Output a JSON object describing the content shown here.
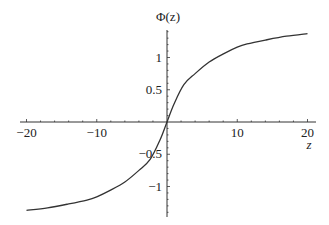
{
  "chart_data": {
    "type": "line",
    "title": "",
    "xlabel": "z",
    "ylabel": "Φ(z)",
    "xlim": [
      -20,
      20
    ],
    "ylim": [
      -1.4,
      1.4
    ],
    "grid": false,
    "legend": null,
    "x_ticks": [
      {
        "value": -20,
        "label": "−20"
      },
      {
        "value": -10,
        "label": "−10"
      },
      {
        "value": 10,
        "label": "10"
      },
      {
        "value": 20,
        "label": "20"
      }
    ],
    "y_ticks": [
      {
        "value": 1,
        "label": "1"
      },
      {
        "value": 0.5,
        "label": "0.5"
      },
      {
        "value": -0.5,
        "label": "−0.5"
      },
      {
        "value": -1,
        "label": "−1"
      }
    ],
    "series": [
      {
        "name": "Φ(z)",
        "color": "#333333",
        "x": [
          -20,
          -17,
          -14,
          -11.4,
          -10,
          -8.1,
          -6,
          -4,
          -2.4,
          -1,
          0,
          1,
          2.4,
          4,
          6,
          8.1,
          10,
          11.4,
          14,
          17,
          20
        ],
        "y": [
          -1.37,
          -1.33,
          -1.27,
          -1.21,
          -1.16,
          -1.06,
          -0.93,
          -0.75,
          -0.58,
          -0.28,
          0,
          0.28,
          0.58,
          0.75,
          0.93,
          1.06,
          1.16,
          1.21,
          1.27,
          1.33,
          1.37
        ]
      }
    ]
  }
}
